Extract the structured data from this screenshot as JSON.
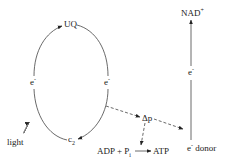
{
  "diagram": {
    "title": "",
    "nodes": {
      "uq": {
        "label": "UQ"
      },
      "e_left": {
        "label": "e",
        "sup": "-"
      },
      "e_right": {
        "label": "e",
        "sup": "-"
      },
      "c2": {
        "label": "c",
        "sub": "2"
      },
      "light": {
        "label": "light"
      },
      "delta_p": {
        "label": "Δp"
      },
      "adp": {
        "label": "ADP + P",
        "sub": "i"
      },
      "atp": {
        "label": "ATP"
      },
      "nad": {
        "label": "NAD",
        "sup": "+"
      },
      "e_vertical": {
        "label": "e",
        "sup": "-"
      },
      "e_donor": {
        "label": "e",
        "sup": "-",
        "suffix": " donor"
      }
    },
    "edges": [
      {
        "from": "e_left",
        "to": "uq",
        "style": "solid",
        "arrow": true
      },
      {
        "from": "uq",
        "to": "e_right",
        "style": "solid",
        "arrow": false
      },
      {
        "from": "e_right",
        "to": "c2",
        "style": "solid",
        "arrow": true
      },
      {
        "from": "c2",
        "to": "e_left",
        "style": "solid",
        "arrow": false
      },
      {
        "from": "light",
        "to": "e_left",
        "style": "wavy",
        "arrow": true
      },
      {
        "from": "e_right",
        "to": "delta_p",
        "style": "dashed",
        "arrow": true
      },
      {
        "from": "delta_p",
        "to": "e_donor",
        "style": "dashed",
        "arrow": true
      },
      {
        "from": "delta_p",
        "to": "atp_reaction",
        "style": "dashed",
        "arrow": true
      },
      {
        "from": "adp",
        "to": "atp",
        "style": "solid",
        "arrow": true
      },
      {
        "from": "e_donor",
        "to": "nad",
        "style": "solid",
        "arrow": true
      }
    ],
    "colors": {
      "line": "#333333",
      "text": "#222222",
      "background": "#ffffff"
    }
  }
}
